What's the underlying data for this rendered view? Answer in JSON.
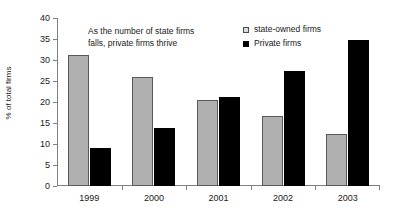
{
  "chart_data": {
    "type": "bar",
    "title": "",
    "subtitle": "",
    "xlabel": "",
    "ylabel": "% of total firms",
    "categories": [
      "1999",
      "2000",
      "2001",
      "2002",
      "2003"
    ],
    "series": [
      {
        "name": "state-owned firms",
        "color": "#b0b0b0",
        "values": [
          31.3,
          26.0,
          20.5,
          16.6,
          12.3
        ]
      },
      {
        "name": "Private firms",
        "color": "#000000",
        "values": [
          9.0,
          13.8,
          21.3,
          27.3,
          34.8
        ]
      }
    ],
    "ylim": [
      0,
      40
    ],
    "ytick_step": 5,
    "yticks": [
      "40",
      "35",
      "30",
      "25",
      "20",
      "15",
      "10",
      "5",
      "0"
    ],
    "grid": false,
    "legend_position": "top-right",
    "annotations": [
      {
        "line1": "As the number of state firms",
        "line2": "falls, private firms thrive"
      }
    ]
  },
  "legend": {
    "items": [
      {
        "label": "state-owned firms",
        "swatch": "legend-swatch-state-owned"
      },
      {
        "label": "Private firms",
        "swatch": "legend-swatch-private"
      }
    ]
  }
}
